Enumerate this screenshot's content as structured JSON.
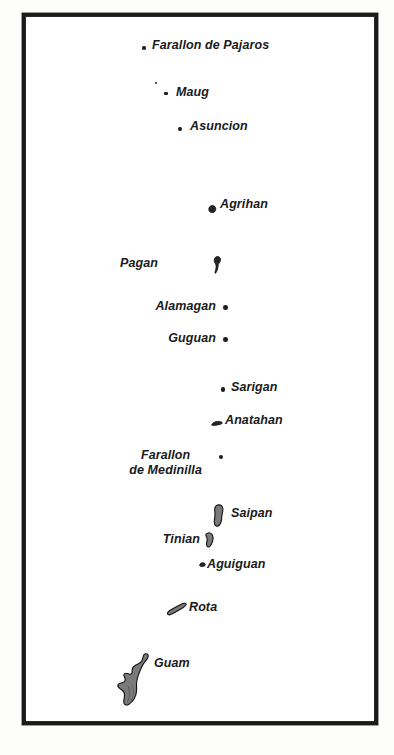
{
  "map": {
    "title": "Mariana Islands chain map",
    "frame": {
      "border_color": "#1a1a1a",
      "background_color": "#ffffff",
      "page_background_color": "#fdfdfc"
    },
    "island_fill_color": "#252525",
    "guam_fill_color": "#7a7a7a",
    "label_color": "#1a1a1a",
    "features": [
      {
        "id": "farallon-de-pajaros",
        "label": "Farallon de Pajaros",
        "marker_type": "dot",
        "marker_x": 116,
        "marker_y": 29,
        "label_x": 126,
        "label_y": 22
      },
      {
        "id": "maug",
        "label": "Maug",
        "marker_type": "dot-pair",
        "marker_x": 132,
        "marker_y": 75,
        "label_x": 150,
        "label_y": 69
      },
      {
        "id": "asuncion",
        "label": "Asuncion",
        "marker_type": "dot",
        "marker_x": 152,
        "marker_y": 110,
        "label_x": 164,
        "label_y": 103
      },
      {
        "id": "agrihan",
        "label": "Agrihan",
        "marker_type": "blob",
        "marker_x": 182,
        "marker_y": 188,
        "label_x": 194,
        "label_y": 181
      },
      {
        "id": "pagan",
        "label": "Pagan",
        "marker_type": "elongated",
        "marker_x": 187,
        "marker_y": 247,
        "label_x": 132,
        "label_y": 247,
        "label_align": "right"
      },
      {
        "id": "alamagan",
        "label": "Alamagan",
        "marker_type": "dot",
        "marker_x": 197,
        "marker_y": 288,
        "label_x": 123,
        "label_y": 282,
        "label_align": "right"
      },
      {
        "id": "guguan",
        "label": "Guguan",
        "marker_type": "dot",
        "marker_x": 197,
        "marker_y": 320,
        "label_x": 137,
        "label_y": 314,
        "label_align": "right"
      },
      {
        "id": "sarigan",
        "label": "Sarigan",
        "marker_type": "dot",
        "marker_x": 195,
        "marker_y": 370,
        "label_x": 205,
        "label_y": 364
      },
      {
        "id": "anatahan",
        "label": "Anatahan",
        "marker_type": "elongated-small",
        "marker_x": 185,
        "marker_y": 403,
        "label_x": 199,
        "label_y": 397
      },
      {
        "id": "farallon-de-medinilla",
        "label": "Farallon\nde Medinilla",
        "label_line1": "Farallon",
        "label_line2": "de Medinilla",
        "marker_type": "dot",
        "marker_x": 193,
        "marker_y": 438,
        "label_x": 130,
        "label_y": 432,
        "label_align": "right"
      },
      {
        "id": "saipan",
        "label": "Saipan",
        "marker_type": "island-saipan",
        "marker_x": 186,
        "marker_y": 497,
        "label_x": 205,
        "label_y": 497
      },
      {
        "id": "tinian",
        "label": "Tinian",
        "marker_type": "island-tinian",
        "marker_x": 178,
        "marker_y": 521,
        "label_x": 123,
        "label_y": 523,
        "label_align": "right"
      },
      {
        "id": "aguiguan",
        "label": "Aguiguan",
        "marker_type": "dot-square",
        "marker_x": 173,
        "marker_y": 545,
        "label_x": 182,
        "label_y": 547
      },
      {
        "id": "rota",
        "label": "Rota",
        "marker_type": "island-rota",
        "marker_x": 140,
        "marker_y": 591,
        "label_x": 163,
        "label_y": 589
      },
      {
        "id": "guam",
        "label": "Guam",
        "marker_type": "island-guam",
        "marker_x": 90,
        "marker_y": 635,
        "label_x": 128,
        "label_y": 640
      }
    ]
  }
}
